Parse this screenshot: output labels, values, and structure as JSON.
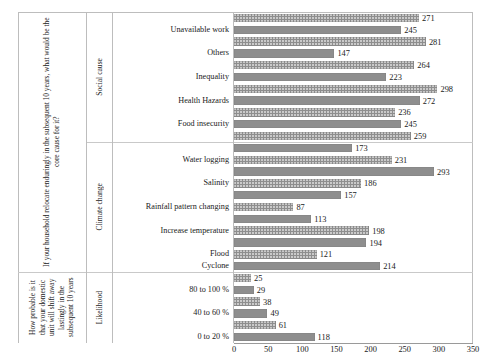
{
  "chart_data": {
    "type": "bar",
    "orientation": "horizontal",
    "title": "",
    "xlabel": "",
    "ylabel": "",
    "xlim": [
      0,
      350
    ],
    "xticks": [
      0,
      50,
      100,
      150,
      200,
      250,
      300,
      350
    ],
    "grid": false,
    "legend": "none",
    "bar_color": "#8e8e8e",
    "groups": [
      {
        "question": "If your household relocate enduringly in the subsequent 10 years, what would be the core cause for it?",
        "category": "Social cause",
        "categories": [
          "Unavailable work",
          "Others",
          "Inequality",
          "Health Hazards",
          "Food insecurity"
        ],
        "bars": [
          271,
          245,
          281,
          147,
          264,
          223,
          298,
          272,
          236,
          245,
          259
        ]
      },
      {
        "question": "If your household relocate enduringly in the subsequent 10 years, what would be the core cause for it?",
        "category": "Climate change",
        "categories": [
          "Water logging",
          "Salinity",
          "Rainfall pattern changing",
          "Increase temperature",
          "Flood",
          "Cyclone"
        ],
        "bars": [
          173,
          231,
          293,
          186,
          157,
          87,
          113,
          198,
          194,
          121,
          214
        ]
      },
      {
        "question": "How probable is it that your domestic unit will shift away lastingly in the subsequent 10 years",
        "category": "Likelihood",
        "categories": [
          "80 to 100 %",
          "40 to 60 %",
          "0 to 20 %"
        ],
        "bars": [
          25,
          29,
          38,
          49,
          61,
          118
        ]
      }
    ],
    "all_values": [
      271,
      245,
      281,
      147,
      264,
      223,
      298,
      272,
      236,
      245,
      259,
      173,
      231,
      293,
      186,
      157,
      87,
      113,
      198,
      194,
      121,
      214,
      25,
      29,
      38,
      49,
      61,
      118
    ]
  },
  "questions": {
    "upper": "If your household relocate enduringly in the subsequent 10 years, what would be the core cause for it?",
    "lower": "How probable is it that your domestic unit will shift away lastingly in the subsequent 10 years"
  },
  "group_labels": {
    "social": "Social cause",
    "climate": "Climate change",
    "likelihood": "Likelihood"
  },
  "row_labels": [
    "Unavailable work",
    "Others",
    "Inequality",
    "Health Hazards",
    "Food insecurity",
    "Water logging",
    "Salinity",
    "Rainfall pattern changing",
    "Increase temperature",
    "Flood",
    "Cyclone",
    "80 to 100 %",
    "40 to 60 %",
    "0 to 20 %"
  ],
  "values": [
    "271",
    "245",
    "281",
    "147",
    "264",
    "223",
    "298",
    "272",
    "236",
    "245",
    "259",
    "173",
    "231",
    "293",
    "186",
    "157",
    "87",
    "113",
    "198",
    "194",
    "121",
    "214",
    "25",
    "29",
    "38",
    "49",
    "61",
    "118"
  ],
  "xticks": [
    "0",
    "50",
    "100",
    "150",
    "200",
    "250",
    "300",
    "350"
  ]
}
